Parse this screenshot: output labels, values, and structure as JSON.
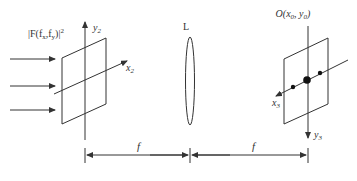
{
  "diagram": {
    "input_label": "|F(f",
    "input_label_full": "|F(fx,fy)|²",
    "input_label_parts": {
      "main": "|F(f",
      "sub1": "x",
      "mid": ",f",
      "sub2": "y",
      "end": ")|",
      "sup": "2"
    },
    "plane2": {
      "y_axis": "y",
      "y_sub": "2",
      "x_axis": "x",
      "x_sub": "2"
    },
    "lens_label": "L",
    "plane3": {
      "origin_label": "O(x",
      "origin_parts": {
        "main": "O(x",
        "sub1": "0",
        "mid": ", y",
        "sub2": "0",
        "end": ")"
      },
      "x_axis": "x",
      "x_sub": "3",
      "y_axis": "y",
      "y_sub": "3"
    },
    "distances": [
      {
        "label": "f"
      },
      {
        "label": "f"
      }
    ],
    "colors": {
      "line": "#333333",
      "background": "#ffffff"
    }
  }
}
